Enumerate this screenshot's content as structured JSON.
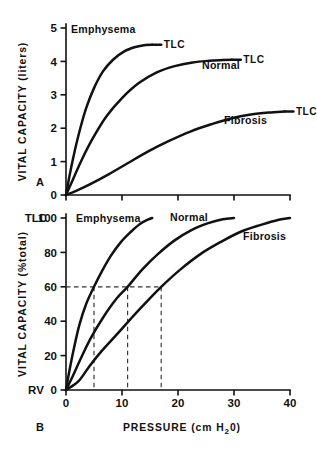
{
  "figure": {
    "background": "#ffffff",
    "ink": "#111111",
    "dash_color": "#333333"
  },
  "panel_a": {
    "id": "A",
    "ylabel": "VITAL CAPACITY (liters)",
    "ylim": [
      0,
      5
    ],
    "yticks": [
      0,
      1,
      2,
      3,
      4,
      5
    ],
    "yticklabels": [
      "0",
      "1",
      "2",
      "3",
      "4",
      "5"
    ],
    "xlim": [
      0,
      40
    ],
    "xticks": [
      0,
      10,
      20,
      30,
      40
    ],
    "xticklabels": [
      "",
      "",
      "",
      "",
      ""
    ],
    "endpoint_label": "TLC",
    "curve_labels": {
      "emphysema": "Emphysema",
      "normal": "Normal",
      "fibrosis": "Fibrosis"
    }
  },
  "panel_b": {
    "id": "B",
    "ylabel": "VITAL CAPACITY (%total)",
    "ylim": [
      0,
      100
    ],
    "yticks": [
      0,
      20,
      40,
      60,
      80,
      100
    ],
    "yticklabels": [
      "0",
      "20",
      "40",
      "60",
      "80",
      "100"
    ],
    "top_marker": "TLC",
    "bottom_marker": "RV",
    "xlabel_main": "PRESSURE",
    "xlabel_units_pre": "(cm H",
    "xlabel_units_sub": "2",
    "xlabel_units_post": "0)",
    "xlim": [
      0,
      40
    ],
    "xticks": [
      0,
      10,
      20,
      30,
      40
    ],
    "xticklabels": [
      "0",
      "10",
      "20",
      "30",
      "40"
    ],
    "reference_level": 60,
    "reference_intercepts": [
      5,
      11,
      17
    ],
    "curve_labels": {
      "emphysema": "Emphysema",
      "normal": "Normal",
      "fibrosis": "Fibrosis"
    }
  },
  "chart_data": [
    {
      "type": "line",
      "title": "A",
      "xlabel": "PRESSURE (cm H2O)",
      "ylabel": "VITAL CAPACITY (liters)",
      "xlim": [
        0,
        40
      ],
      "ylim": [
        0,
        5
      ],
      "xticks": [
        0,
        10,
        20,
        30,
        40
      ],
      "yticks": [
        0,
        1,
        2,
        3,
        4,
        5
      ],
      "grid": false,
      "legend": "inline curve labels",
      "annotations": [
        "TLC",
        "TLC",
        "TLC"
      ],
      "series": [
        {
          "name": "Emphysema",
          "tlc": 4.5,
          "x": [
            0,
            0.6,
            1.4,
            2.4,
            3.6,
            5.0,
            6.6,
            8.4,
            10.4,
            12.4,
            14.2,
            15.4
          ],
          "y": [
            0,
            0.55,
            1.2,
            1.9,
            2.6,
            3.2,
            3.7,
            4.05,
            4.3,
            4.43,
            4.49,
            4.5
          ]
        },
        {
          "name": "Normal",
          "tlc": 4.05,
          "x": [
            0,
            1.2,
            2.8,
            4.8,
            7.2,
            10.0,
            13.0,
            16.2,
            19.4,
            22.6,
            25.6,
            28.0,
            29.6
          ],
          "y": [
            0,
            0.45,
            1.05,
            1.7,
            2.35,
            2.9,
            3.35,
            3.67,
            3.86,
            3.97,
            4.02,
            4.04,
            4.05
          ]
        },
        {
          "name": "Fibrosis",
          "tlc": 2.5,
          "x": [
            0,
            2.0,
            4.6,
            7.6,
            11.0,
            14.6,
            18.4,
            22.2,
            26.0,
            29.6,
            33.0,
            36.2,
            39.0
          ],
          "y": [
            0,
            0.14,
            0.35,
            0.62,
            0.95,
            1.3,
            1.62,
            1.9,
            2.12,
            2.3,
            2.41,
            2.47,
            2.5
          ]
        }
      ]
    },
    {
      "type": "line",
      "title": "B",
      "xlabel": "PRESSURE (cm H2O)",
      "ylabel": "VITAL CAPACITY (%total)",
      "xlim": [
        0,
        40
      ],
      "ylim": [
        0,
        100
      ],
      "xticks": [
        0,
        10,
        20,
        30,
        40
      ],
      "yticks": [
        0,
        20,
        40,
        60,
        80,
        100
      ],
      "grid": false,
      "legend": "inline curve labels",
      "annotations": [
        "60% reference line",
        "intercepts at 5, 11 and 17 cm H2O"
      ],
      "reference_line_y": 60,
      "reference_intercepts_x": [
        5,
        11,
        17
      ],
      "series": [
        {
          "name": "Emphysema",
          "x": [
            0,
            0.6,
            1.4,
            2.4,
            3.6,
            5.0,
            6.4,
            8.0,
            9.8,
            11.6,
            13.2,
            14.6,
            15.4
          ],
          "y": [
            0,
            11,
            24,
            38,
            50,
            60,
            69,
            78,
            86,
            92,
            96.5,
            99,
            100
          ]
        },
        {
          "name": "Normal",
          "x": [
            0,
            1.2,
            2.6,
            4.4,
            6.6,
            9.0,
            11.0,
            13.6,
            16.4,
            19.4,
            22.4,
            25.4,
            28.0,
            30.0
          ],
          "y": [
            0,
            8,
            18,
            30,
            42,
            53,
            60,
            70,
            79,
            87,
            93,
            97,
            99.3,
            100
          ]
        },
        {
          "name": "Fibrosis",
          "x": [
            0,
            2.2,
            4.0,
            6.2,
            9.0,
            12.0,
            14.6,
            17.0,
            20.4,
            24.0,
            27.6,
            31.2,
            34.8,
            38.0,
            40.0
          ],
          "y": [
            0,
            5,
            13,
            22,
            32,
            43,
            52,
            60,
            70,
            79,
            86,
            92,
            96,
            99,
            100
          ]
        }
      ]
    }
  ]
}
